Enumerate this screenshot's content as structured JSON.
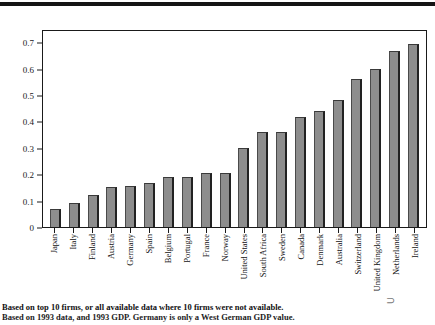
{
  "chart_data": {
    "type": "bar",
    "title": "",
    "subtitle": "",
    "xlabel": "",
    "ylabel": "",
    "ylim": [
      0,
      0.75
    ],
    "grid": false,
    "legend": null,
    "ytick_labels": [
      "0",
      "0.1",
      "0.2",
      "0.3",
      "0.4",
      "0.5",
      "0.6",
      "0.7"
    ],
    "ytick_values": [
      0,
      0.1,
      0.2,
      0.3,
      0.4,
      0.5,
      0.6,
      0.7
    ],
    "categories": [
      "Japan",
      "Italy",
      "Finland",
      "Austria",
      "Germany",
      "Spain",
      "Belgium",
      "Portugal",
      "France",
      "Norway",
      "United States",
      "South Africa",
      "Sweden",
      "Canada",
      "Denmark",
      "Australia",
      "Switzerland",
      "United Kingdom",
      "Netherlands",
      "Ireland"
    ],
    "values": [
      0.07,
      0.09,
      0.12,
      0.15,
      0.155,
      0.165,
      0.19,
      0.19,
      0.205,
      0.205,
      0.3,
      0.36,
      0.36,
      0.415,
      0.44,
      0.48,
      0.56,
      0.6,
      0.665,
      0.695
    ],
    "bar_color": "#8d8d8d",
    "axis_color": "#1a1a1a"
  },
  "footnote": {
    "line1": "Based on top 10 firms, or all available data where 10 firms were not available.",
    "line2": "Based on 1993 data, and 1993 GDP. Germany is only a West German GDP value."
  },
  "decor": {
    "corner_glyph": "⊃"
  }
}
